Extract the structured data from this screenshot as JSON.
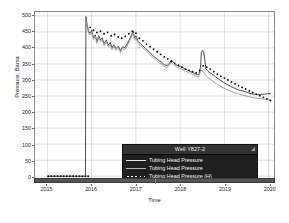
{
  "chart_data": {
    "type": "line",
    "title": "",
    "xlabel": "Time",
    "ylabel": "Pressure, Barsa",
    "xlim": [
      2014.72,
      2020.12
    ],
    "ylim": [
      -18,
      512
    ],
    "grid": true,
    "yticks": [
      0,
      50,
      100,
      150,
      200,
      250,
      300,
      350,
      400,
      450,
      500
    ],
    "ytick_labels": [
      "0",
      "50",
      "100",
      "150",
      "200",
      "250",
      "300",
      "350",
      "400",
      "450",
      "500"
    ],
    "xticks": [
      2015,
      2016,
      2017,
      2018,
      2019,
      2020
    ],
    "xtick_labels": [
      "2015",
      "2016",
      "2017",
      "2018",
      "2019",
      "2020"
    ],
    "legend": {
      "position": "bottom-right",
      "title": "Well Y827-2",
      "entries": [
        {
          "label": "Tubing Head Pressure",
          "style": "line",
          "color": "#e8e8e8"
        },
        {
          "label": "Tubing Head Pressure",
          "style": "line",
          "color": "#b4b4b4"
        },
        {
          "label": "Tubing Head Pressure (H)",
          "style": "dotted",
          "color": "#ffffff"
        }
      ]
    },
    "series": [
      {
        "name": "Tubing Head Pressure",
        "style": "line",
        "color": "#3c3c3c",
        "points": [
          [
            2015.0,
            0
          ],
          [
            2015.1,
            0
          ],
          [
            2015.2,
            0
          ],
          [
            2015.3,
            0
          ],
          [
            2015.4,
            0
          ],
          [
            2015.5,
            0
          ],
          [
            2015.6,
            0
          ],
          [
            2015.7,
            0
          ],
          [
            2015.8,
            0
          ],
          [
            2015.86,
            0
          ],
          [
            2015.87,
            498
          ],
          [
            2015.9,
            470
          ],
          [
            2015.93,
            452
          ],
          [
            2015.96,
            446
          ],
          [
            2016.0,
            455
          ],
          [
            2016.04,
            432
          ],
          [
            2016.08,
            441
          ],
          [
            2016.12,
            420
          ],
          [
            2016.16,
            438
          ],
          [
            2016.2,
            425
          ],
          [
            2016.24,
            432
          ],
          [
            2016.28,
            413
          ],
          [
            2016.33,
            425
          ],
          [
            2016.38,
            408
          ],
          [
            2016.42,
            417
          ],
          [
            2016.46,
            400
          ],
          [
            2016.5,
            410
          ],
          [
            2016.55,
            398
          ],
          [
            2016.6,
            405
          ],
          [
            2016.65,
            392
          ],
          [
            2016.7,
            404
          ],
          [
            2016.75,
            400
          ],
          [
            2016.8,
            412
          ],
          [
            2016.85,
            425
          ],
          [
            2016.9,
            440
          ],
          [
            2016.94,
            452
          ],
          [
            2016.97,
            430
          ],
          [
            2017.0,
            438
          ],
          [
            2017.05,
            420
          ],
          [
            2017.1,
            414
          ],
          [
            2017.16,
            406
          ],
          [
            2017.22,
            398
          ],
          [
            2017.28,
            390
          ],
          [
            2017.34,
            382
          ],
          [
            2017.4,
            374
          ],
          [
            2017.46,
            368
          ],
          [
            2017.52,
            360
          ],
          [
            2017.58,
            355
          ],
          [
            2017.64,
            348
          ],
          [
            2017.7,
            345
          ],
          [
            2017.76,
            352
          ],
          [
            2017.8,
            362
          ],
          [
            2017.84,
            357
          ],
          [
            2017.88,
            350
          ],
          [
            2017.94,
            345
          ],
          [
            2018.0,
            342
          ],
          [
            2018.06,
            338
          ],
          [
            2018.12,
            334
          ],
          [
            2018.18,
            330
          ],
          [
            2018.24,
            326
          ],
          [
            2018.3,
            322
          ],
          [
            2018.36,
            318
          ],
          [
            2018.42,
            316
          ],
          [
            2018.46,
            340
          ],
          [
            2018.48,
            386
          ],
          [
            2018.5,
            392
          ],
          [
            2018.53,
            390
          ],
          [
            2018.56,
            360
          ],
          [
            2018.58,
            336
          ],
          [
            2018.62,
            328
          ],
          [
            2018.68,
            322
          ],
          [
            2018.74,
            316
          ],
          [
            2018.8,
            310
          ],
          [
            2018.86,
            304
          ],
          [
            2018.92,
            298
          ],
          [
            2018.98,
            292
          ],
          [
            2019.06,
            286
          ],
          [
            2019.14,
            280
          ],
          [
            2019.22,
            275
          ],
          [
            2019.3,
            270
          ],
          [
            2019.4,
            266
          ],
          [
            2019.5,
            262
          ],
          [
            2019.58,
            258
          ],
          [
            2019.66,
            256
          ],
          [
            2019.74,
            254
          ],
          [
            2019.82,
            255
          ],
          [
            2019.9,
            256
          ],
          [
            2019.98,
            257
          ],
          [
            2020.05,
            258
          ]
        ]
      },
      {
        "name": "Tubing Head Pressure",
        "style": "line",
        "color": "#9a9a9a",
        "points": [
          [
            2015.87,
            492
          ],
          [
            2015.9,
            463
          ],
          [
            2015.93,
            446
          ],
          [
            2015.96,
            440
          ],
          [
            2016.0,
            449
          ],
          [
            2016.04,
            426
          ],
          [
            2016.08,
            435
          ],
          [
            2016.12,
            414
          ],
          [
            2016.16,
            432
          ],
          [
            2016.2,
            419
          ],
          [
            2016.24,
            426
          ],
          [
            2016.28,
            407
          ],
          [
            2016.33,
            419
          ],
          [
            2016.38,
            402
          ],
          [
            2016.42,
            411
          ],
          [
            2016.46,
            394
          ],
          [
            2016.5,
            404
          ],
          [
            2016.55,
            392
          ],
          [
            2016.6,
            399
          ],
          [
            2016.65,
            386
          ],
          [
            2016.7,
            398
          ],
          [
            2016.75,
            394
          ],
          [
            2016.8,
            406
          ],
          [
            2016.85,
            419
          ],
          [
            2016.9,
            434
          ],
          [
            2016.94,
            446
          ],
          [
            2016.97,
            424
          ],
          [
            2017.0,
            432
          ],
          [
            2017.05,
            414
          ],
          [
            2017.1,
            408
          ],
          [
            2017.16,
            400
          ],
          [
            2017.22,
            392
          ],
          [
            2017.28,
            384
          ],
          [
            2017.34,
            376
          ],
          [
            2017.4,
            368
          ],
          [
            2017.46,
            362
          ],
          [
            2017.52,
            354
          ],
          [
            2017.58,
            349
          ],
          [
            2017.64,
            342
          ],
          [
            2017.7,
            339
          ],
          [
            2017.76,
            346
          ],
          [
            2017.8,
            356
          ],
          [
            2017.84,
            351
          ],
          [
            2017.88,
            344
          ],
          [
            2017.94,
            339
          ],
          [
            2018.0,
            336
          ],
          [
            2018.06,
            332
          ],
          [
            2018.12,
            328
          ],
          [
            2018.18,
            324
          ],
          [
            2018.24,
            320
          ],
          [
            2018.3,
            316
          ],
          [
            2018.36,
            312
          ],
          [
            2018.42,
            310
          ],
          [
            2018.46,
            326
          ],
          [
            2018.48,
            330
          ],
          [
            2018.5,
            328
          ],
          [
            2018.53,
            324
          ],
          [
            2018.56,
            318
          ],
          [
            2018.58,
            314
          ],
          [
            2018.62,
            308
          ],
          [
            2018.68,
            302
          ],
          [
            2018.74,
            296
          ],
          [
            2018.8,
            290
          ],
          [
            2018.86,
            285
          ],
          [
            2018.92,
            280
          ],
          [
            2018.98,
            275
          ],
          [
            2019.06,
            270
          ],
          [
            2019.14,
            265
          ],
          [
            2019.22,
            261
          ],
          [
            2019.3,
            257
          ],
          [
            2019.4,
            253
          ],
          [
            2019.5,
            250
          ],
          [
            2019.58,
            247
          ],
          [
            2019.66,
            245
          ],
          [
            2019.74,
            243
          ],
          [
            2019.82,
            242
          ],
          [
            2019.9,
            240
          ],
          [
            2019.98,
            238
          ],
          [
            2020.05,
            237
          ]
        ]
      },
      {
        "name": "Tubing Head Pressure (H)",
        "style": "dotted",
        "color": "#111111",
        "points": [
          [
            2015.02,
            0
          ],
          [
            2015.09,
            0
          ],
          [
            2015.16,
            0
          ],
          [
            2015.23,
            0
          ],
          [
            2015.3,
            0
          ],
          [
            2015.37,
            0
          ],
          [
            2015.44,
            0
          ],
          [
            2015.51,
            0
          ],
          [
            2015.58,
            0
          ],
          [
            2015.65,
            0
          ],
          [
            2015.72,
            0
          ],
          [
            2015.79,
            0
          ],
          [
            2015.86,
            0
          ],
          [
            2015.92,
            0
          ],
          [
            2015.97,
            464
          ],
          [
            2016.04,
            455
          ],
          [
            2016.12,
            448
          ],
          [
            2016.2,
            452
          ],
          [
            2016.28,
            444
          ],
          [
            2016.36,
            448
          ],
          [
            2016.44,
            438
          ],
          [
            2016.52,
            442
          ],
          [
            2016.6,
            434
          ],
          [
            2016.68,
            430
          ],
          [
            2016.76,
            436
          ],
          [
            2016.84,
            444
          ],
          [
            2016.92,
            452
          ],
          [
            2017.0,
            446
          ],
          [
            2017.08,
            430
          ],
          [
            2017.16,
            422
          ],
          [
            2017.24,
            412
          ],
          [
            2017.32,
            404
          ],
          [
            2017.4,
            396
          ],
          [
            2017.48,
            388
          ],
          [
            2017.56,
            380
          ],
          [
            2017.64,
            372
          ],
          [
            2017.72,
            366
          ],
          [
            2017.8,
            358
          ],
          [
            2017.88,
            352
          ],
          [
            2017.96,
            346
          ],
          [
            2018.04,
            340
          ],
          [
            2018.12,
            334
          ],
          [
            2018.2,
            330
          ],
          [
            2018.28,
            326
          ],
          [
            2018.36,
            322
          ],
          [
            2018.44,
            330
          ],
          [
            2018.52,
            344
          ],
          [
            2018.6,
            340
          ],
          [
            2018.68,
            334
          ],
          [
            2018.76,
            326
          ],
          [
            2018.84,
            318
          ],
          [
            2018.92,
            312
          ],
          [
            2019.0,
            306
          ],
          [
            2019.08,
            300
          ],
          [
            2019.16,
            294
          ],
          [
            2019.24,
            288
          ],
          [
            2019.32,
            282
          ],
          [
            2019.4,
            277
          ],
          [
            2019.48,
            272
          ],
          [
            2019.56,
            266
          ],
          [
            2019.64,
            261
          ],
          [
            2019.72,
            256
          ],
          [
            2019.8,
            251
          ],
          [
            2019.88,
            246
          ],
          [
            2019.96,
            241
          ],
          [
            2020.04,
            236
          ]
        ]
      }
    ]
  }
}
